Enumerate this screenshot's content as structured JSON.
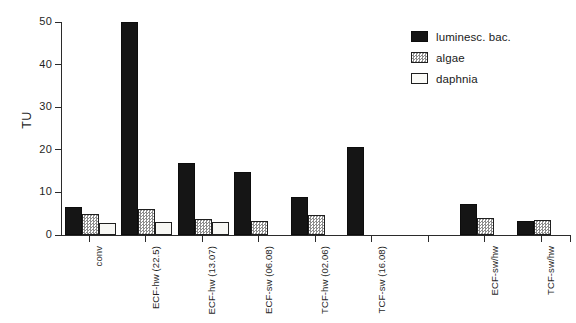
{
  "chart_data": {
    "type": "bar",
    "title": "",
    "xlabel": "",
    "ylabel": "TU",
    "ylim": [
      0,
      50
    ],
    "yticks": [
      0,
      10,
      20,
      30,
      40,
      50
    ],
    "ytick_labels": [
      "0",
      "10",
      "20",
      "30",
      "40",
      "50"
    ],
    "grid": false,
    "legend_position": "top-right",
    "categories": [
      "conv",
      "ECF-hw (22.5)",
      "ECF-hw (13.07)",
      "ECF-sw (06.08)",
      "TCF-hw (02.06)",
      "TCF-sw (16.08)",
      "",
      "ECF-sw/hw",
      "TCF-sw/hw"
    ],
    "series": [
      {
        "name": "luminesc. bac.",
        "color": "#151515",
        "values": [
          6.6,
          50.0,
          17.0,
          14.8,
          9.0,
          20.7,
          null,
          7.3,
          3.2
        ]
      },
      {
        "name": "algae",
        "color": "#8d8d8d",
        "values": [
          4.9,
          6.1,
          3.8,
          3.2,
          4.7,
          null,
          null,
          4.0,
          3.5
        ]
      },
      {
        "name": "daphnia",
        "color": "#f7f7f4",
        "values": [
          2.8,
          3.0,
          3.1,
          null,
          null,
          null,
          null,
          null,
          null
        ]
      }
    ]
  },
  "legend": {
    "items": [
      {
        "label": "luminesc. bac.",
        "swatch": "filled-black-swatch"
      },
      {
        "label": "algae",
        "swatch": "hatched-gray-swatch"
      },
      {
        "label": "daphnia",
        "swatch": "empty-white-swatch"
      }
    ]
  },
  "axes": {
    "y_title": "TU",
    "y_tick_labels": [
      "50",
      "40",
      "30",
      "20",
      "10",
      "0"
    ],
    "x_tick_labels": [
      "conv",
      "ECF-hw (22.5)",
      "ECF-hw (13.07)",
      "ECF-sw (06.08)",
      "TCF-hw (02.06)",
      "TCF-sw (16.08)",
      "",
      "ECF-sw/hw",
      "TCF-sw/hw"
    ]
  }
}
